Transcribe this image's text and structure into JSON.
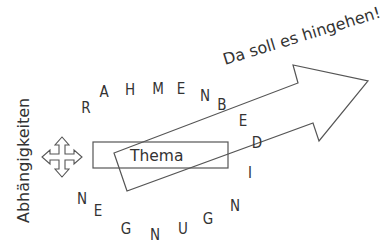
{
  "diagram": {
    "goal_label": "Da soll es hingehen!",
    "topic_label": "Thema",
    "dependencies_label": "Abhängigkeiten",
    "frame_word": "RAHMENBEDINGUNGEN",
    "frame_letters": [
      {
        "char": "R",
        "x": 86,
        "y": 113
      },
      {
        "char": "A",
        "x": 104,
        "y": 97
      },
      {
        "char": "H",
        "x": 130,
        "y": 95
      },
      {
        "char": "M",
        "x": 158,
        "y": 94
      },
      {
        "char": "E",
        "x": 181,
        "y": 94
      },
      {
        "char": "N",
        "x": 205,
        "y": 101
      },
      {
        "char": "B",
        "x": 222,
        "y": 110
      },
      {
        "char": "E",
        "x": 243,
        "y": 126
      },
      {
        "char": "D",
        "x": 257,
        "y": 148
      },
      {
        "char": "I",
        "x": 250,
        "y": 178
      },
      {
        "char": "N",
        "x": 235,
        "y": 211
      },
      {
        "char": "G",
        "x": 208,
        "y": 224
      },
      {
        "char": "U",
        "x": 183,
        "y": 234
      },
      {
        "char": "N",
        "x": 155,
        "y": 240
      },
      {
        "char": "G",
        "x": 126,
        "y": 234
      },
      {
        "char": "E",
        "x": 98,
        "y": 216
      },
      {
        "char": "N",
        "x": 82,
        "y": 204
      }
    ],
    "colors": {
      "stroke": "#555555",
      "text": "#333333",
      "background": "#ffffff"
    }
  }
}
